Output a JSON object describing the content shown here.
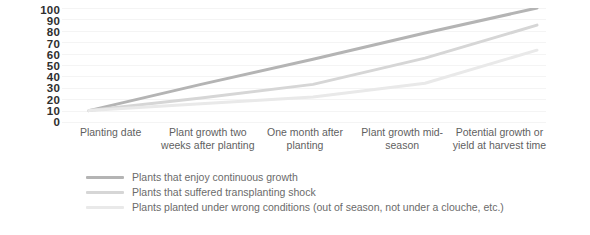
{
  "chart_data": {
    "type": "line",
    "title": "",
    "subtitle": "",
    "xlabel": "",
    "ylabel": "",
    "ylim": [
      0,
      100
    ],
    "grid": true,
    "legend_position": "bottom-left",
    "yticks": [
      "100",
      "90",
      "80",
      "70",
      "60",
      "50",
      "40",
      "30",
      "20",
      "10",
      "0"
    ],
    "categories": [
      "Planting date",
      "Plant growth two weeks after planting",
      "One month after planting",
      "Plant growth mid-season",
      "Potential growth or yield at harvest time"
    ],
    "series": [
      {
        "name": "Plants that enjoy continuous growth",
        "color": "#b4b4b4",
        "values": [
          10,
          33,
          55,
          78,
          100
        ]
      },
      {
        "name": "Plants that suffered transplanting shock",
        "color": "#d6d6d6",
        "values": [
          10,
          21,
          33,
          56,
          85
        ]
      },
      {
        "name": "Plants planted under wrong conditions (out of season, not under a clouche, etc.)",
        "color": "#e9e9e9",
        "values": [
          10,
          16,
          22,
          34,
          63
        ]
      }
    ]
  },
  "axis": {
    "tick_color": "#2f2f2f",
    "gridline_color": "#f4f4f4"
  }
}
